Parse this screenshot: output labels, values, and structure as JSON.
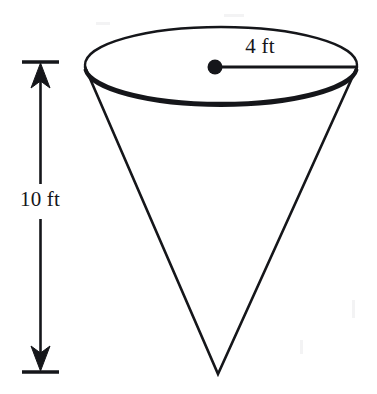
{
  "figure": {
    "kind": "geometry-diagram",
    "shape_name": "cone",
    "orientation": "inverted",
    "background_color": "#ffffff",
    "stroke_color": "#15161a",
    "labels": {
      "height": "10 ft",
      "radius": "4 ft"
    },
    "measurements": [
      {
        "name": "height",
        "value": 10,
        "unit": "ft",
        "text": "10 ft"
      },
      {
        "name": "radius",
        "value": 4,
        "unit": "ft",
        "text": "4 ft"
      }
    ],
    "geometry": {
      "ellipse_center_x": 221,
      "ellipse_center_y": 65,
      "ellipse_rx": 136,
      "ellipse_ry": 38,
      "apex_x": 218,
      "apex_y": 374,
      "radius_dot_x": 215,
      "radius_dot_y": 67,
      "radius_line_end_x": 356,
      "dimension_line_x": 40,
      "dimension_top_y": 62,
      "dimension_bottom_y": 372,
      "tick_left_x": 22,
      "tick_right_x": 59
    }
  }
}
